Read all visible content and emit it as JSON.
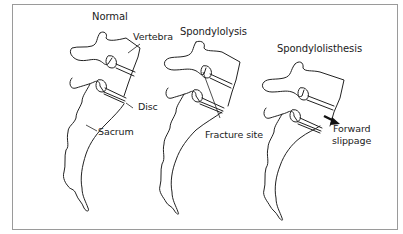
{
  "figure": {
    "panels": [
      {
        "id": "normal",
        "title": "Normal",
        "labels": {
          "vertebra": "Vertebra",
          "disc": "Disc",
          "sacrum": "Sacrum"
        }
      },
      {
        "id": "spondylolysis",
        "title": "Spondylolysis",
        "labels": {
          "fracture": "Fracture site"
        }
      },
      {
        "id": "spondylolisthesis",
        "title": "Spondylolisthesis",
        "labels": {
          "slippage_line1": "Forward",
          "slippage_line2": "slippage"
        },
        "icons": [
          "arrow-forward-icon"
        ]
      }
    ],
    "colors": {
      "line": "#222222",
      "frame": "#9a9a9a",
      "background": "#ffffff"
    }
  }
}
